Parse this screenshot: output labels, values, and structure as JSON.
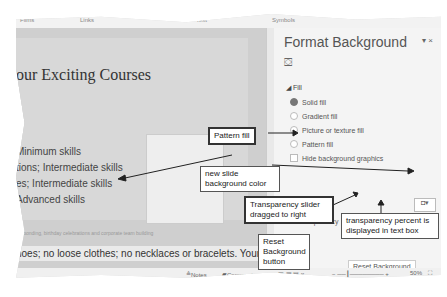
{
  "ribbon": {
    "groups": [
      "Films",
      "Links",
      "Text",
      "Symbols"
    ]
  },
  "slide": {
    "title": "our Exciting Courses",
    "bullets": [
      "Minimum skills",
      "tions; Intermediate skills",
      "es; Intermediate skills",
      "Advanced skills"
    ],
    "faint_text": "for bonding, birthday celebrations and corporate team building",
    "page_num": "3"
  },
  "notes": {
    "text": "hoes; no loose clothes; no necklaces or bracelets. Your"
  },
  "panel": {
    "title": "Format Background",
    "controls": "▾ ×",
    "section": "Fill",
    "options": [
      {
        "label": "Solid fill",
        "selected": true
      },
      {
        "label": "Gradient fill",
        "selected": false
      },
      {
        "label": "Picture or texture fill",
        "selected": false
      },
      {
        "label": "Pattern fill",
        "selected": false
      }
    ],
    "hide_graphics": "Hide background graphics",
    "color_label": "Color",
    "transparency_label": "Transparency",
    "transparency_value": "50%",
    "reset_label": "Reset Background"
  },
  "status": {
    "notes": "Notes",
    "comments": "Comments",
    "zoom": "50%"
  },
  "callouts": {
    "pattern_fill": "Pattern fill",
    "new_bg_color": "new slide background color",
    "slider_dragged": "Transparency slider dragged to right",
    "percent_text": "transparency percent is displayed in text box",
    "reset_button": "Reset Background button"
  }
}
